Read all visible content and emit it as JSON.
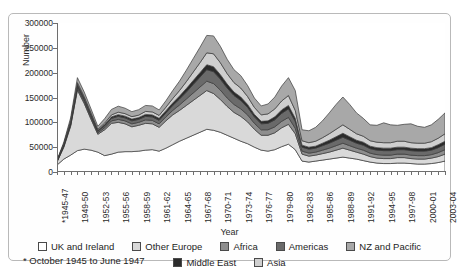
{
  "title_sliver": "",
  "chart_data": {
    "type": "area",
    "stacked": true,
    "title": "",
    "xlabel": "Year",
    "ylabel": "Number",
    "ylim": [
      0,
      300000
    ],
    "ytick_values": [
      0,
      50000,
      100000,
      150000,
      200000,
      250000,
      300000
    ],
    "ytick_labels": [
      "0",
      "50000",
      "100000",
      "150000",
      "200000",
      "250000",
      "300000"
    ],
    "grid": false,
    "legend_position": "bottom",
    "footnote": "* October 1945 to June 1947",
    "categories": [
      "*1945-47",
      "1947-48",
      "1948-49",
      "1949-50",
      "1950-51",
      "1951-52",
      "1952-53",
      "1953-54",
      "1954-55",
      "1955-56",
      "1956-57",
      "1957-58",
      "1958-59",
      "1959-60",
      "1960-61",
      "1961-62",
      "1962-63",
      "1963-64",
      "1964-65",
      "1965-66",
      "1966-67",
      "1967-68",
      "1968-69",
      "1969-70",
      "1970-71",
      "1971-72",
      "1972-73",
      "1973-74",
      "1974-75",
      "1975-76",
      "1976-77",
      "1977-78",
      "1978-79",
      "1979-80",
      "1980-81",
      "1981-82",
      "1982-83",
      "1983-84",
      "1984-85",
      "1985-86",
      "1986-87",
      "1987-88",
      "1988-89",
      "1989-90",
      "1990-91",
      "1991-92",
      "1992-93",
      "1993-94",
      "1994-95",
      "1995-96",
      "1996-97",
      "1997-98",
      "1998-99",
      "1999-00",
      "2000-01",
      "2001-02",
      "2002-03",
      "2003-04"
    ],
    "xtick_labels_shown": [
      "*1945-47",
      "1949-50",
      "1952-53",
      "1955-56",
      "1958-59",
      "1961-62",
      "1964-65",
      "1967-68",
      "1970-71",
      "1973-74",
      "1976-77",
      "1979-80",
      "1982-83",
      "1985-86",
      "1988-89",
      "1991-92",
      "1994-95",
      "1997-98",
      "2000-01",
      "2003-04"
    ],
    "series": [
      {
        "name": "UK and Ireland",
        "color": "#ffffff",
        "values": [
          14000,
          26000,
          34000,
          43000,
          46000,
          44000,
          40000,
          33000,
          36000,
          40000,
          41000,
          41000,
          42000,
          44000,
          45000,
          42000,
          48000,
          55000,
          62000,
          68000,
          74000,
          80000,
          86000,
          84000,
          80000,
          74000,
          68000,
          62000,
          57000,
          50000,
          44000,
          42000,
          45000,
          51000,
          56000,
          45000,
          22000,
          20000,
          22000,
          24000,
          26000,
          28000,
          30000,
          28000,
          26000,
          23000,
          20000,
          18000,
          17000,
          17000,
          18000,
          18000,
          17000,
          16000,
          16000,
          17000,
          19000,
          22000
        ]
      },
      {
        "name": "Other Europe",
        "color": "#d9d9d9",
        "values": [
          6000,
          24000,
          58000,
          122000,
          92000,
          62000,
          36000,
          52000,
          62000,
          60000,
          56000,
          50000,
          52000,
          54000,
          52000,
          48000,
          55000,
          60000,
          62000,
          66000,
          70000,
          74000,
          78000,
          74000,
          66000,
          58000,
          52000,
          50000,
          44000,
          36000,
          30000,
          32000,
          34000,
          38000,
          40000,
          32000,
          14000,
          12000,
          12000,
          13000,
          14000,
          16000,
          18000,
          16000,
          14000,
          13000,
          11000,
          10000,
          10000,
          10000,
          11000,
          11000,
          10000,
          10000,
          10000,
          11000,
          12000,
          14000
        ]
      },
      {
        "name": "Africa",
        "color": "#8e8e8e",
        "values": [
          1000,
          2000,
          3000,
          4000,
          4000,
          4000,
          3000,
          4000,
          5000,
          6000,
          6000,
          6000,
          6000,
          7000,
          7000,
          7000,
          8000,
          9000,
          11000,
          13000,
          15000,
          17000,
          19000,
          20000,
          19000,
          17000,
          16000,
          15000,
          14000,
          12000,
          11000,
          11000,
          12000,
          13000,
          14000,
          11000,
          6000,
          6000,
          6000,
          7000,
          8000,
          9000,
          10000,
          9000,
          8000,
          8000,
          7000,
          7000,
          7000,
          7000,
          7000,
          7000,
          7000,
          7000,
          7000,
          7000,
          8000,
          9000
        ]
      },
      {
        "name": "Americas",
        "color": "#6a6a6a",
        "values": [
          1000,
          2000,
          3000,
          4000,
          4000,
          4000,
          3000,
          4000,
          5000,
          6000,
          6000,
          6000,
          6000,
          7000,
          7000,
          7000,
          8000,
          10000,
          12000,
          14000,
          17000,
          20000,
          23000,
          24000,
          22000,
          20000,
          18000,
          17000,
          15000,
          13000,
          12000,
          13000,
          14000,
          16000,
          17000,
          14000,
          8000,
          8000,
          8000,
          9000,
          10000,
          11000,
          12000,
          11000,
          10000,
          10000,
          9000,
          9000,
          9000,
          9000,
          9000,
          9000,
          9000,
          9000,
          9000,
          9000,
          10000,
          11000
        ]
      },
      {
        "name": "Middle East",
        "color": "#2b2b2b",
        "values": [
          500,
          1500,
          2500,
          3500,
          3000,
          2500,
          2000,
          2500,
          3000,
          3500,
          3500,
          3500,
          3500,
          4000,
          4000,
          4000,
          4500,
          5000,
          6000,
          7000,
          8000,
          9000,
          10000,
          10000,
          9000,
          8000,
          7000,
          7000,
          6000,
          5000,
          5000,
          5000,
          6000,
          7000,
          7000,
          6000,
          4000,
          4000,
          4000,
          5000,
          6000,
          7000,
          8000,
          7000,
          6000,
          6000,
          5000,
          5000,
          5000,
          5000,
          5000,
          5000,
          5000,
          5000,
          5000,
          5000,
          6000,
          6000
        ]
      },
      {
        "name": "Asia",
        "color": "#cfcfcf",
        "values": [
          500,
          1500,
          2500,
          3500,
          3000,
          2500,
          2000,
          3000,
          4000,
          5000,
          5000,
          5000,
          5000,
          6000,
          6000,
          6000,
          7000,
          9000,
          11000,
          14000,
          17000,
          20000,
          24000,
          26000,
          24000,
          21000,
          19000,
          18000,
          16000,
          14000,
          13000,
          14000,
          16000,
          18000,
          20000,
          16000,
          9000,
          9000,
          10000,
          11000,
          13000,
          15000,
          17000,
          15000,
          13000,
          12000,
          11000,
          11000,
          11000,
          11000,
          12000,
          12000,
          11000,
          11000,
          11000,
          12000,
          13000,
          15000
        ]
      },
      {
        "name": "NZ and Pacific",
        "color": "#a8a8a8",
        "values": [
          1000,
          3000,
          6000,
          10000,
          9000,
          8000,
          6000,
          9000,
          11000,
          12000,
          11000,
          10000,
          11000,
          12000,
          12000,
          11000,
          13000,
          16000,
          19000,
          23000,
          27000,
          31000,
          35000,
          36000,
          33000,
          29000,
          26000,
          25000,
          22000,
          19000,
          18000,
          20000,
          24000,
          30000,
          36000,
          40000,
          22000,
          24000,
          28000,
          34000,
          42000,
          50000,
          56000,
          50000,
          42000,
          36000,
          32000,
          34000,
          40000,
          36000,
          32000,
          34000,
          38000,
          34000,
          32000,
          34000,
          38000,
          42000
        ]
      }
    ]
  },
  "legend": {
    "row1": [
      {
        "label": "UK and Ireland",
        "color": "#ffffff"
      },
      {
        "label": "Other Europe",
        "color": "#d9d9d9"
      },
      {
        "label": "Africa",
        "color": "#8e8e8e"
      },
      {
        "label": "Americas",
        "color": "#6a6a6a"
      },
      {
        "label": "NZ and Pacific",
        "color": "#a8a8a8"
      }
    ],
    "row2": [
      {
        "label": "Middle East",
        "color": "#2b2b2b"
      },
      {
        "label": "Asia",
        "color": "#cfcfcf"
      }
    ]
  }
}
